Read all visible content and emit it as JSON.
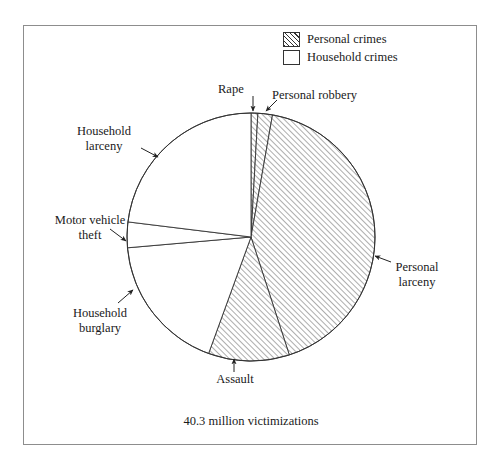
{
  "figure": {
    "caption": "40.3 million victimizations"
  },
  "legend": {
    "items": [
      {
        "label": "Personal crimes",
        "swatch": "hatched-square-icon"
      },
      {
        "label": "Household crimes",
        "swatch": "empty-square-icon"
      }
    ]
  },
  "callouts": {
    "rape": "Rape",
    "personal_robbery": "Personal robbery",
    "household_larceny": "Household\nlarceny",
    "motor_vehicle_theft": "Motor vehicle\ntheft",
    "household_burglary": "Household\nburglary",
    "assault": "Assault",
    "personal_larceny": "Personal\nlarceny"
  },
  "chart_data": {
    "type": "pie",
    "title": "",
    "subtitle": "",
    "total_label": "40.3 million victimizations",
    "total_value": 40.3,
    "total_units": "million victimizations",
    "legend": [
      "Personal crimes",
      "Household crimes"
    ],
    "legend_position": "top-right",
    "grid": false,
    "start_angle_deg": 0,
    "direction": "clockwise",
    "categories": [
      "Rape",
      "Personal robbery",
      "Personal larceny",
      "Assault",
      "Household burglary",
      "Motor vehicle theft",
      "Household larceny"
    ],
    "values": [
      0.9,
      1.9,
      42.2,
      10.6,
      18.1,
      3.3,
      23.0
    ],
    "slices": [
      {
        "label": "Rape",
        "group": "Personal crimes",
        "percent": 0.9,
        "start_deg": 0.0,
        "end_deg": 3.2,
        "fill": "hatched"
      },
      {
        "label": "Personal robbery",
        "group": "Personal crimes",
        "percent": 1.9,
        "start_deg": 3.2,
        "end_deg": 10.0,
        "fill": "hatched"
      },
      {
        "label": "Personal larceny",
        "group": "Personal crimes",
        "percent": 42.2,
        "start_deg": 10.0,
        "end_deg": 162.0,
        "fill": "hatched"
      },
      {
        "label": "Assault",
        "group": "Personal crimes",
        "percent": 10.6,
        "start_deg": 162.0,
        "end_deg": 200.0,
        "fill": "hatched"
      },
      {
        "label": "Household burglary",
        "group": "Household crimes",
        "percent": 18.1,
        "start_deg": 200.0,
        "end_deg": 265.0,
        "fill": "plain"
      },
      {
        "label": "Motor vehicle theft",
        "group": "Household crimes",
        "percent": 3.3,
        "start_deg": 265.0,
        "end_deg": 277.0,
        "fill": "plain"
      },
      {
        "label": "Household larceny",
        "group": "Household crimes",
        "percent": 23.0,
        "start_deg": 277.0,
        "end_deg": 360.0,
        "fill": "plain"
      }
    ],
    "geometry": {
      "center_x": 251,
      "center_y": 237,
      "radius": 124
    }
  },
  "colors": {
    "stroke": "#333333",
    "frame": "#8d8d8d",
    "background": "#ffffff",
    "hatch": "#333333"
  }
}
